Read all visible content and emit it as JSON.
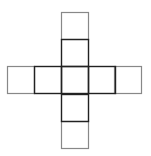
{
  "diagram": {
    "type": "cross-net",
    "cell_size": 27,
    "colors": {
      "inner_stroke": "#222222",
      "outer_stroke": "#888888",
      "background": "#ffffff"
    },
    "squares": [
      {
        "id": "top-outer",
        "col": 2,
        "row": 0,
        "tone": "outer"
      },
      {
        "id": "top-inner",
        "col": 2,
        "row": 1,
        "tone": "inner"
      },
      {
        "id": "left-outer",
        "col": 0,
        "row": 2,
        "tone": "outer"
      },
      {
        "id": "left-inner",
        "col": 1,
        "row": 2,
        "tone": "inner"
      },
      {
        "id": "center",
        "col": 2,
        "row": 2,
        "tone": "inner"
      },
      {
        "id": "right-inner",
        "col": 3,
        "row": 2,
        "tone": "inner"
      },
      {
        "id": "right-outer",
        "col": 4,
        "row": 2,
        "tone": "outer"
      },
      {
        "id": "bottom-inner",
        "col": 2,
        "row": 3,
        "tone": "inner"
      },
      {
        "id": "bottom-outer",
        "col": 2,
        "row": 4,
        "tone": "outer"
      }
    ],
    "col_x": [
      7,
      34,
      61,
      88,
      114
    ],
    "row_y": [
      12,
      39,
      66,
      94,
      121
    ]
  }
}
